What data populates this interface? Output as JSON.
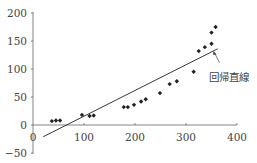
{
  "chart_data": {
    "type": "scatter",
    "title": "",
    "xlabel": "",
    "ylabel": "",
    "xlim": [
      0,
      400
    ],
    "ylim": [
      -50,
      200
    ],
    "x_ticks": [
      "0",
      "100",
      "200",
      "300",
      "400"
    ],
    "y_ticks": [
      "200",
      "150",
      "100",
      "50",
      "0",
      "-50"
    ],
    "grid": false,
    "series": [
      {
        "name": "data",
        "marker": "diamond",
        "color": "#222222",
        "points": [
          [
            37,
            7
          ],
          [
            45,
            8
          ],
          [
            53,
            8
          ],
          [
            96,
            18
          ],
          [
            111,
            16
          ],
          [
            119,
            17
          ],
          [
            178,
            32
          ],
          [
            186,
            32
          ],
          [
            198,
            36
          ],
          [
            212,
            42
          ],
          [
            221,
            46
          ],
          [
            249,
            57
          ],
          [
            268,
            73
          ],
          [
            282,
            78
          ],
          [
            315,
            95
          ],
          [
            325,
            132
          ],
          [
            337,
            139
          ],
          [
            350,
            145
          ],
          [
            350,
            165
          ],
          [
            358,
            175
          ]
        ]
      },
      {
        "name": "回帰直線",
        "type": "line",
        "color": "#222222",
        "points": [
          [
            20,
            -21
          ],
          [
            362,
            136
          ]
        ]
      }
    ],
    "annotations": [
      {
        "text": "回帰直線",
        "arrow_to": [
          354,
          136
        ]
      }
    ]
  },
  "labels": {
    "annotation": "回帰直線",
    "origin": "0"
  }
}
